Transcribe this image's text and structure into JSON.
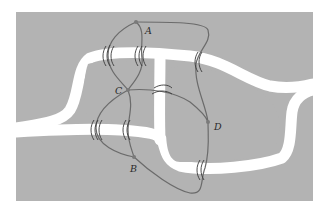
{
  "figure": {
    "colors": {
      "land": "#b3b3b3",
      "river": "#ffffff",
      "edge": "#6b6b6b",
      "bridge": "#3a3a3a",
      "node": "#7a7a7a",
      "label": "#2a2a2a"
    },
    "nodes": [
      {
        "id": "A",
        "label": "A",
        "x": 136,
        "y": 22
      },
      {
        "id": "B",
        "label": "B",
        "x": 134,
        "y": 157
      },
      {
        "id": "C",
        "label": "C",
        "x": 128,
        "y": 90
      },
      {
        "id": "D",
        "label": "D",
        "x": 208,
        "y": 122
      }
    ],
    "edges": [
      {
        "from": "A",
        "to": "C",
        "bridge": 1
      },
      {
        "from": "A",
        "to": "C",
        "bridge": 2
      },
      {
        "from": "A",
        "to": "D",
        "bridge": 3
      },
      {
        "from": "C",
        "to": "D",
        "bridge": 4
      },
      {
        "from": "C",
        "to": "B",
        "bridge": 5
      },
      {
        "from": "C",
        "to": "B",
        "bridge": 6
      },
      {
        "from": "B",
        "to": "D",
        "bridge": 7
      }
    ],
    "bridge_count": 7
  }
}
